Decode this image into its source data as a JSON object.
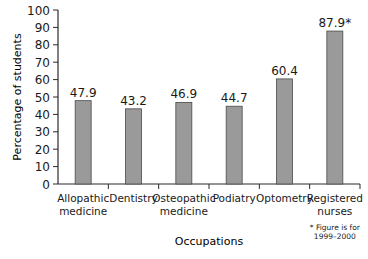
{
  "chart_data": {
    "type": "bar",
    "title": "",
    "xlabel": "Occupations",
    "ylabel": "Percentage of students",
    "ylim": [
      0,
      100
    ],
    "yticks": [
      0,
      10,
      20,
      30,
      40,
      50,
      60,
      70,
      80,
      90,
      100
    ],
    "grid": false,
    "categories": [
      [
        "Allopathic",
        "medicine"
      ],
      [
        "Dentistry"
      ],
      [
        "Osteopathic",
        "medicine"
      ],
      [
        "Podiatry"
      ],
      [
        "Optometry"
      ],
      [
        "Registered",
        "nurses"
      ]
    ],
    "values": [
      47.9,
      43.2,
      46.9,
      44.7,
      60.4,
      87.9
    ],
    "value_labels": [
      "47.9",
      "43.2",
      "46.9",
      "44.7",
      "60.4",
      "87.9*"
    ],
    "footnote": [
      "* Figure is for",
      "1999–2000"
    ],
    "colors": {
      "bar_fill": "#9a9a9a",
      "bar_stroke": "#4a4a4a",
      "axis": "#2a2a2a",
      "text": "#1a1a1a"
    }
  }
}
